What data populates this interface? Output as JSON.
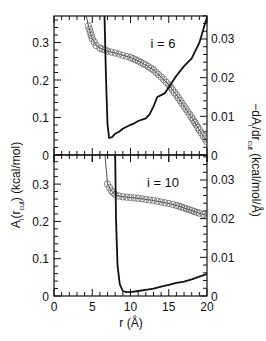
{
  "page_header": "",
  "chart_data": [
    {
      "type": "line",
      "panel": "top",
      "annotation": "i = 6",
      "xlabel": "r (Å)",
      "ylabel_left": "A_i(r_cut) (kcal/mol)",
      "ylabel_right": "−dA_i/dr_cut (kcal/mol/Å)",
      "xlim": [
        0,
        20
      ],
      "ylim_left": [
        0,
        0.37
      ],
      "ylim_right": [
        0,
        0.036
      ],
      "x_ticks": [
        "0",
        "5",
        "10",
        "15",
        "20"
      ],
      "y_ticks_left": [
        "0",
        "0.1",
        "0.2",
        "0.3"
      ],
      "y_ticks_right": [
        "0",
        "0.01",
        "0.02",
        "0.03"
      ],
      "series": [
        {
          "name": "A_i(r_cut)",
          "axis": "left",
          "style": "circles-with-thin-line",
          "x": [
            4.5,
            5.0,
            5.5,
            6.0,
            7.0,
            8.0,
            9.0,
            10.0,
            11.0,
            12.0,
            13.0,
            14.0,
            15.0,
            16.0,
            17.0,
            18.0,
            19.0,
            20.0
          ],
          "y": [
            0.344,
            0.31,
            0.292,
            0.285,
            0.277,
            0.272,
            0.266,
            0.26,
            0.251,
            0.24,
            0.227,
            0.208,
            0.187,
            0.16,
            0.13,
            0.1,
            0.067,
            0.035
          ]
        },
        {
          "name": "-dA_i/dr_cut",
          "axis": "right",
          "style": "solid-thick",
          "x": [
            6.6,
            6.8,
            7.0,
            7.2,
            7.6,
            8.0,
            8.5,
            9.0,
            10.0,
            10.5,
            11.0,
            12.0,
            12.5,
            13.0,
            13.5,
            14.0,
            14.5,
            15.0,
            16.0,
            17.0,
            18.0,
            19.0,
            20.0
          ],
          "y": [
            0.036,
            0.02,
            0.008,
            0.0044,
            0.0046,
            0.0055,
            0.006,
            0.0068,
            0.0078,
            0.0082,
            0.0088,
            0.0095,
            0.0105,
            0.0125,
            0.015,
            0.0155,
            0.016,
            0.0175,
            0.0205,
            0.023,
            0.025,
            0.029,
            0.0357
          ]
        }
      ]
    },
    {
      "type": "line",
      "panel": "bottom",
      "annotation": "i = 10",
      "xlabel": "r (Å)",
      "xlim": [
        0,
        20
      ],
      "ylim_left": [
        0,
        0.3
      ],
      "ylim_right": [
        0,
        0.036
      ],
      "x_ticks": [
        "0",
        "5",
        "10",
        "15",
        "20"
      ],
      "y_ticks_left": [
        "0",
        "0.1",
        "0.2",
        "0.3"
      ],
      "y_ticks_right": [
        "0",
        "0.01",
        "0.02",
        "0.03"
      ],
      "series": [
        {
          "name": "A_i(r_cut)",
          "axis": "left",
          "style": "circles-with-thin-line",
          "x": [
            7.0,
            7.5,
            8.0,
            8.5,
            9.0,
            10.0,
            11.0,
            12.0,
            13.0,
            14.0,
            15.0,
            16.0,
            17.0,
            18.0,
            19.0,
            20.0
          ],
          "y": [
            0.3,
            0.282,
            0.272,
            0.268,
            0.266,
            0.264,
            0.262,
            0.259,
            0.256,
            0.252,
            0.248,
            0.243,
            0.236,
            0.229,
            0.222,
            0.216
          ]
        },
        {
          "name": "-dA_i/dr_cut",
          "axis": "right",
          "style": "solid-thick",
          "x": [
            8.0,
            8.1,
            8.3,
            8.6,
            9.0,
            9.5,
            10.0,
            11.0,
            12.0,
            13.0,
            14.0,
            15.0,
            16.0,
            17.0,
            18.0,
            19.0,
            20.0
          ],
          "y": [
            0.036,
            0.02,
            0.008,
            0.003,
            0.0013,
            0.001,
            0.001,
            0.0013,
            0.0016,
            0.0019,
            0.0024,
            0.0029,
            0.0034,
            0.0037,
            0.0043,
            0.005,
            0.0057
          ]
        }
      ]
    }
  ],
  "labels": {
    "annotation_top": "i = 6",
    "annotation_bottom": "i = 10",
    "xlabel": "r (Å)",
    "ylabel_left_main": "A",
    "ylabel_left_sub": "i",
    "ylabel_left_paren_open": "(r",
    "ylabel_left_sub2": "cut",
    "ylabel_left_rest": ") (kcal/mol)",
    "ylabel_right_main": "−dA",
    "ylabel_right_sub": "i",
    "ylabel_right_mid": "/dr",
    "ylabel_right_sub2": "cut",
    "ylabel_right_rest": " (kcal/mol/Å)"
  }
}
